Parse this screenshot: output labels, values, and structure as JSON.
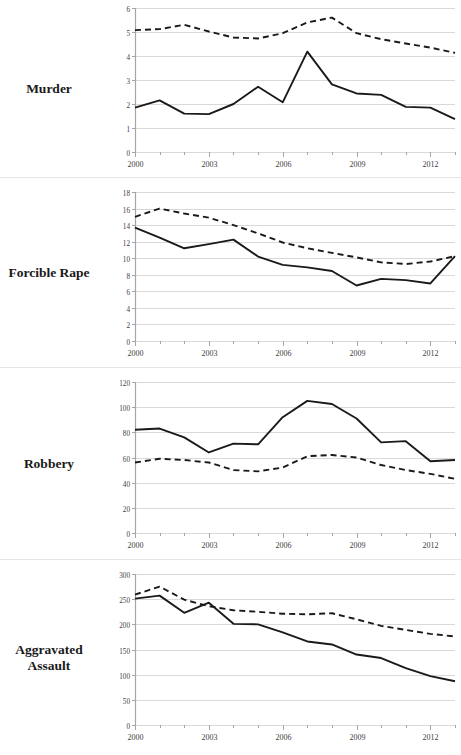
{
  "page": {
    "background_color": "#ffffff",
    "series_colors": {
      "solid": "#1a1a1a",
      "dashed": "#1a1a1a"
    },
    "grid_color": "#d9d9d9",
    "axis_color": "#a6a6a6",
    "tick_label_color": "#404040"
  },
  "row_labels": {
    "murder": "Murder",
    "forcible_rape": "Forcible Rape",
    "aggravated_assault_line1": "Aggravated",
    "aggravated_assault_line2": "Assault"
  },
  "chart_data": [
    {
      "id": "murder",
      "type": "line",
      "title": "Murder",
      "xlabel": "",
      "ylabel": "",
      "x": [
        2000,
        2001,
        2002,
        2003,
        2004,
        2005,
        2006,
        2007,
        2008,
        2009,
        2010,
        2011,
        2012,
        2013
      ],
      "xlim": [
        2000,
        2013
      ],
      "xticks": [
        2000,
        2003,
        2006,
        2009,
        2012
      ],
      "xticklabels": [
        "2000",
        "2003",
        "2006",
        "2009",
        "2012"
      ],
      "xminorticks": [
        2001,
        2002,
        2004,
        2005,
        2007,
        2008,
        2010,
        2011,
        2013
      ],
      "ylim": [
        0,
        6
      ],
      "yticks": [
        0,
        1,
        2,
        3,
        4,
        5,
        6
      ],
      "yticklabels": [
        "0",
        "1",
        "2",
        "3",
        "4",
        "5",
        "6"
      ],
      "grid": true,
      "legend": "none",
      "series": [
        {
          "name": "solid",
          "style": "solid",
          "values": [
            1.85,
            2.15,
            1.6,
            1.58,
            2.0,
            2.72,
            2.07,
            4.18,
            2.82,
            2.44,
            2.38,
            1.88,
            1.85,
            1.37
          ]
        },
        {
          "name": "dashed",
          "style": "dashed",
          "values": [
            5.08,
            5.12,
            5.3,
            5.02,
            4.77,
            4.73,
            4.95,
            5.4,
            5.6,
            4.95,
            4.7,
            4.52,
            4.35,
            4.13
          ]
        }
      ]
    },
    {
      "id": "forcible_rape",
      "type": "line",
      "title": "Forcible Rape",
      "xlabel": "",
      "ylabel": "",
      "x": [
        2000,
        2001,
        2002,
        2003,
        2004,
        2005,
        2006,
        2007,
        2008,
        2009,
        2010,
        2011,
        2012,
        2013
      ],
      "xlim": [
        2000,
        2013
      ],
      "xticks": [
        2000,
        2003,
        2006,
        2009,
        2012
      ],
      "xticklabels": [
        "2000",
        "2003",
        "2006",
        "2009",
        "2012"
      ],
      "xminorticks": [
        2001,
        2002,
        2004,
        2005,
        2007,
        2008,
        2010,
        2011,
        2013
      ],
      "ylim": [
        0,
        18
      ],
      "yticks": [
        0,
        2,
        4,
        6,
        8,
        10,
        12,
        14,
        16,
        18
      ],
      "yticklabels": [
        "0",
        "2",
        "4",
        "6",
        "8",
        "10",
        "12",
        "14",
        "16",
        "18"
      ],
      "grid": true,
      "legend": "none",
      "series": [
        {
          "name": "solid",
          "style": "solid",
          "values": [
            13.7,
            12.5,
            11.2,
            11.7,
            12.25,
            10.2,
            9.2,
            8.9,
            8.45,
            6.7,
            7.5,
            7.35,
            6.95,
            10.25
          ]
        },
        {
          "name": "dashed",
          "style": "dashed",
          "values": [
            15.0,
            16.0,
            15.4,
            14.9,
            14.0,
            13.0,
            11.9,
            11.2,
            10.65,
            10.1,
            9.5,
            9.3,
            9.6,
            10.25
          ]
        }
      ]
    },
    {
      "id": "robbery",
      "type": "line",
      "title": "Robbery",
      "xlabel": "",
      "ylabel": "",
      "x": [
        2000,
        2001,
        2002,
        2003,
        2004,
        2005,
        2006,
        2007,
        2008,
        2009,
        2010,
        2011,
        2012,
        2013
      ],
      "xlim": [
        2000,
        2013
      ],
      "xticks": [
        2000,
        2003,
        2006,
        2009,
        2012
      ],
      "xticklabels": [
        "2000",
        "2003",
        "2006",
        "2009",
        "2012"
      ],
      "xminorticks": [
        2001,
        2002,
        2004,
        2005,
        2007,
        2008,
        2010,
        2011,
        2013
      ],
      "ylim": [
        0,
        120
      ],
      "yticks": [
        0,
        20,
        40,
        60,
        80,
        100,
        120
      ],
      "yticklabels": [
        "0",
        "20",
        "40",
        "60",
        "80",
        "100",
        "120"
      ],
      "grid": true,
      "legend": "none",
      "series": [
        {
          "name": "solid",
          "style": "solid",
          "values": [
            82,
            83,
            76,
            64,
            71,
            70.5,
            92,
            105,
            102.5,
            91,
            72,
            73,
            57,
            58
          ]
        },
        {
          "name": "dashed",
          "style": "dashed",
          "values": [
            56,
            59,
            58,
            56,
            50,
            49,
            52,
            61,
            62,
            60,
            54,
            50,
            47,
            43
          ]
        }
      ]
    },
    {
      "id": "aggravated_assault",
      "type": "line",
      "title": "Aggravated Assault",
      "xlabel": "",
      "ylabel": "",
      "x": [
        2000,
        2001,
        2002,
        2003,
        2004,
        2005,
        2006,
        2007,
        2008,
        2009,
        2010,
        2011,
        2012,
        2013
      ],
      "xlim": [
        2000,
        2013
      ],
      "xticks": [
        2000,
        2003,
        2006,
        2009,
        2012
      ],
      "xticklabels": [
        "2000",
        "2003",
        "2006",
        "2009",
        "2012"
      ],
      "xminorticks": [
        2001,
        2002,
        2004,
        2005,
        2007,
        2008,
        2010,
        2011,
        2013
      ],
      "ylim": [
        0,
        300
      ],
      "yticks": [
        0,
        50,
        100,
        150,
        200,
        250,
        300
      ],
      "yticklabels": [
        "0",
        "50",
        "100",
        "150",
        "200",
        "250",
        "300"
      ],
      "grid": true,
      "legend": "none",
      "series": [
        {
          "name": "solid",
          "style": "solid",
          "values": [
            251,
            257,
            223,
            243,
            201,
            200,
            184,
            166,
            160,
            140,
            133,
            113,
            97,
            87
          ]
        },
        {
          "name": "dashed",
          "style": "dashed",
          "values": [
            259,
            275,
            249,
            236,
            228,
            225,
            221,
            220,
            222,
            210,
            197,
            189,
            181,
            176
          ]
        }
      ]
    }
  ]
}
